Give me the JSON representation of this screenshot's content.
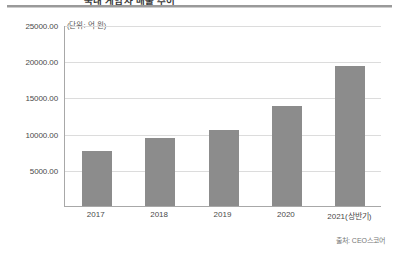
{
  "header": {
    "title": "국내 게임사 매출 추이",
    "rule_color": "#9a9a9a"
  },
  "chart_data": {
    "type": "bar",
    "title": "국내 게임사 매출 추이",
    "unit_label": "(단위: 억 원)",
    "categories": [
      "2017",
      "2018",
      "2019",
      "2020",
      "2021(상반기)"
    ],
    "values": [
      7570,
      9450,
      10450,
      13800,
      19350
    ],
    "series": [
      {
        "name": "매출",
        "values": [
          7570,
          9450,
          10450,
          13800,
          19350
        ]
      }
    ],
    "xlabel": "",
    "ylabel": "",
    "ylim": [
      0,
      25000
    ],
    "ytick_values": [
      5000,
      10000,
      15000,
      20000,
      25000
    ],
    "ytick_labels": [
      "5000.00",
      "10000.00",
      "15000.00",
      "20000.00",
      "25000.00"
    ],
    "grid": true,
    "legend": "none",
    "bar_color": "#8c8c8c",
    "grid_color": "#dcdcdc",
    "axis_color": "#a8a8a8",
    "source": "출처: CEO스코어"
  },
  "footer": {
    "source": "출처: CEO스코어"
  }
}
